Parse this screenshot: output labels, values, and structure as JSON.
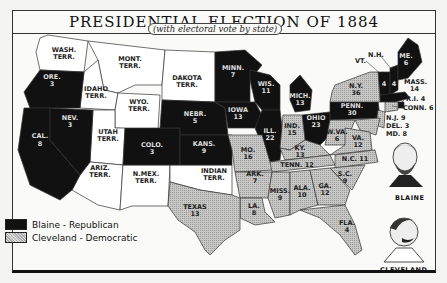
{
  "title": "PRESIDENTIAL ELECTION OF 1884",
  "subtitle": "(with electoral vote by state)",
  "legend": [
    {
      "label": "Blaine - Republican",
      "color": "#111111",
      "party": "republican"
    },
    {
      "label": "Cleveland - Democratic",
      "color": "#bbbbbb",
      "party": "democratic"
    }
  ],
  "candidates": {
    "blaine": "BLAINE",
    "cleveland": "CLEVELAND"
  },
  "republican_states": [
    {
      "name": "ORE.",
      "votes": "3"
    },
    {
      "name": "CAL.",
      "votes": "8"
    },
    {
      "name": "NEV.",
      "votes": "3"
    },
    {
      "name": "COLO.",
      "votes": "3"
    },
    {
      "name": "NEBR.",
      "votes": "5"
    },
    {
      "name": "KANS.",
      "votes": "9"
    },
    {
      "name": "MINN.",
      "votes": "7"
    },
    {
      "name": "IOWA",
      "votes": "13"
    },
    {
      "name": "WIS.",
      "votes": "11"
    },
    {
      "name": "ILL.",
      "votes": "22"
    },
    {
      "name": "MICH.",
      "votes": "13"
    },
    {
      "name": "OHIO",
      "votes": "23"
    },
    {
      "name": "PENN.",
      "votes": "30"
    },
    {
      "name": "VT.",
      "votes": "4"
    },
    {
      "name": "N.H.",
      "votes": "4"
    },
    {
      "name": "ME.",
      "votes": "6"
    },
    {
      "name": "MASS.",
      "votes": "14"
    },
    {
      "name": "R.I.",
      "votes": "4"
    }
  ],
  "democratic_states": [
    {
      "name": "TEXAS",
      "votes": "13"
    },
    {
      "name": "ARK.",
      "votes": "7"
    },
    {
      "name": "LA.",
      "votes": "8"
    },
    {
      "name": "MO.",
      "votes": "16"
    },
    {
      "name": "MISS.",
      "votes": "9"
    },
    {
      "name": "ALA.",
      "votes": "10"
    },
    {
      "name": "GA.",
      "votes": "12"
    },
    {
      "name": "FLA.",
      "votes": "4"
    },
    {
      "name": "TENN.",
      "votes": "12"
    },
    {
      "name": "KY.",
      "votes": "13"
    },
    {
      "name": "IND.",
      "votes": "15"
    },
    {
      "name": "W.VA.",
      "votes": "6"
    },
    {
      "name": "VA.",
      "votes": "12"
    },
    {
      "name": "N.C.",
      "votes": "11"
    },
    {
      "name": "S.C.",
      "votes": "9"
    },
    {
      "name": "N.Y.",
      "votes": "36"
    },
    {
      "name": "N.J.",
      "votes": "9"
    },
    {
      "name": "DEL.",
      "votes": "3"
    },
    {
      "name": "MD.",
      "votes": "8"
    },
    {
      "name": "CONN.",
      "votes": "6"
    }
  ],
  "territories": [
    "WASH. TERR.",
    "MONT. TERR.",
    "IDAHO TERR.",
    "WYO. TERR.",
    "DAKOTA TERR.",
    "UTAH TERR.",
    "ARIZ. TERR.",
    "N.MEX. TERR.",
    "INDIAN TERR."
  ],
  "labels": {
    "wash": "WASH.",
    "wash2": "TERR.",
    "mont": "MONT.",
    "mont2": "TERR.",
    "idaho": "IDAHO",
    "idaho2": "TERR.",
    "wyo": "WYO.",
    "wyo2": "TERR.",
    "dakota": "DAKOTA",
    "dakota2": "TERR.",
    "utah": "UTAH",
    "utah2": "TERR.",
    "ariz": "ARIZ.",
    "ariz2": "TERR.",
    "nmex": "N.MEX.",
    "nmex2": "TERR.",
    "indian": "INDIAN",
    "indian2": "TERR.",
    "ore": "ORE.",
    "ore_v": "3",
    "cal": "CAL.",
    "cal_v": "8",
    "nev": "NEV.",
    "nev_v": "3",
    "colo": "COLO.",
    "colo_v": "3",
    "nebr": "NEBR.",
    "nebr_v": "5",
    "kans": "KANS.",
    "kans_v": "9",
    "minn": "MINN.",
    "minn_v": "7",
    "iowa": "IOWA",
    "iowa_v": "13",
    "wis": "WIS.",
    "wis_v": "11",
    "ill": "ILL.",
    "ill_v": "22",
    "mich": "MICH.",
    "mich_v": "13",
    "ohio": "OHIO",
    "ohio_v": "23",
    "penn": "PENN.",
    "penn_v": "30",
    "ny": "N.Y.",
    "ny_v": "36",
    "me": "ME.",
    "me_v": "6",
    "vt_v": "4",
    "nh_v": "4",
    "vt": "VT.",
    "nh": "N.H.",
    "mass": "MASS.",
    "mass_v": "14",
    "ri": "R.I. 4",
    "conn": "CONN. 6",
    "nj": "N.J. 9",
    "del": "DEL. 3",
    "md": "MD. 8",
    "texas": "TEXAS",
    "texas_v": "13",
    "ark": "ARK.",
    "ark_v": "7",
    "la": "LA.",
    "la_v": "8",
    "mo": "MO.",
    "mo_v": "16",
    "miss": "MISS.",
    "miss_v": "9",
    "ala": "ALA.",
    "ala_v": "10",
    "ga": "GA.",
    "ga_v": "12",
    "fla": "FLA.",
    "fla_v": "4",
    "tenn": "TENN. 12",
    "ky": "KY.",
    "ky_v": "13",
    "ind": "IND.",
    "ind_v": "15",
    "wva": "W.VA.",
    "wva_v": "6",
    "va": "VA.",
    "va_v": "12",
    "nc": "N.C. 11",
    "sc": "S.C.",
    "sc_v": "9"
  }
}
